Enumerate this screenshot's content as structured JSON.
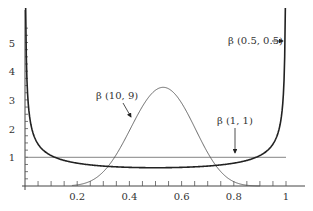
{
  "chart_data": {
    "type": "line",
    "title": "",
    "xlabel": "",
    "ylabel": "",
    "xlim": [
      0,
      1
    ],
    "ylim": [
      0,
      5.8
    ],
    "x_ticks": [
      0.2,
      0.4,
      0.6,
      0.8,
      1
    ],
    "x_tick_labels": [
      "0.2",
      "0.4",
      "0.6",
      "0.8",
      "1"
    ],
    "y_ticks": [
      1,
      2,
      3,
      4,
      5
    ],
    "y_tick_labels": [
      "1",
      "2",
      "3",
      "4",
      "5"
    ],
    "grid": false,
    "legend": "none (inline annotations with arrows)",
    "series": [
      {
        "name": "β(0.5, 0.5)",
        "alpha": 0.5,
        "beta": 0.5,
        "style": "thick dark",
        "label": "β (0.5, 0.5)"
      },
      {
        "name": "β(10, 9)",
        "alpha": 10,
        "beta": 9,
        "style": "thin",
        "peak_x": 0.53,
        "peak_y": 3.5,
        "label": "β (10, 9)"
      },
      {
        "name": "β(1, 1)",
        "alpha": 1,
        "beta": 1,
        "style": "thin horizontal",
        "y": 1,
        "label": "β (1, 1)"
      }
    ],
    "annotations": [
      {
        "text": "β (0.5, 0.5)",
        "arrow_to": [
          0.99,
          4.5
        ]
      },
      {
        "text": "β (10, 9)",
        "arrow_to": [
          0.35,
          1.6
        ]
      },
      {
        "text": "β (1, 1)",
        "arrow_to": [
          0.8,
          1.0
        ]
      }
    ]
  },
  "labels": {
    "ann_half": "β (0.5, 0.5)",
    "ann_ten_nine": "β (10, 9)",
    "ann_one_one": "β (1, 1)",
    "x_ticks": [
      "0.2",
      "0.4",
      "0.6",
      "0.8",
      "1"
    ],
    "y_ticks": [
      "1",
      "2",
      "3",
      "4",
      "5"
    ]
  }
}
